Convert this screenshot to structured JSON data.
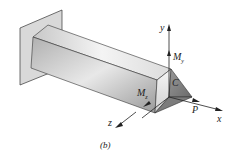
{
  "figure": {
    "caption": "(b)",
    "labels": {
      "y_axis": "y",
      "x_axis": "x",
      "z_axis": "z",
      "moment_y": "M",
      "moment_y_sub": "y",
      "moment_z": "M",
      "moment_z_sub": "z",
      "centroid": "C",
      "load": "P"
    },
    "colors": {
      "wall": "#d9d9d9",
      "beam_light": "#f2f2f2",
      "beam_dark": "#8a8a8a",
      "line": "#222222"
    }
  }
}
